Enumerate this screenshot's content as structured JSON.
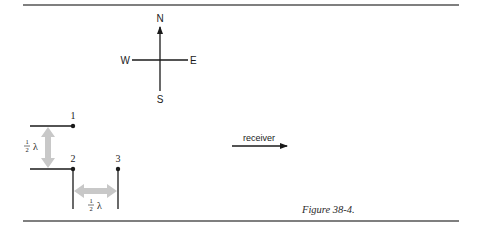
{
  "figure": {
    "caption": "Figure 38-4.",
    "compass": {
      "north": "N",
      "south": "S",
      "east": "E",
      "west": "W"
    },
    "antennas": [
      {
        "label": "1"
      },
      {
        "label": "2"
      },
      {
        "label": "3"
      }
    ],
    "spacing": {
      "vertical": {
        "numerator": "1",
        "denominator": "2",
        "symbol": "λ"
      },
      "horizontal": {
        "numerator": "1",
        "denominator": "2",
        "symbol": "λ"
      }
    },
    "receiver": {
      "label": "receiver"
    },
    "colors": {
      "line": "#1a1a1a",
      "rule": "#555555",
      "spacing_arrow": "#c8c8c8"
    }
  }
}
